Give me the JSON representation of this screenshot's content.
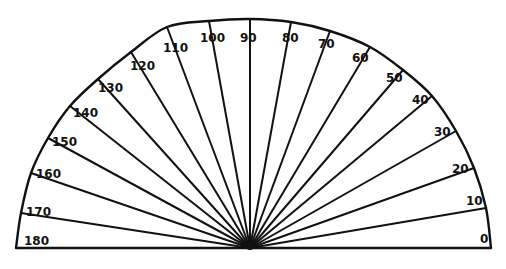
{
  "diagram": {
    "title": "",
    "type": "protractor",
    "stroke_color": "#111111",
    "background": "#ffffff",
    "center": {
      "x": 250,
      "y": 248
    },
    "baseline": {
      "x1": 16,
      "x2": 491,
      "y": 248
    },
    "arc": {
      "rx": 237,
      "ry": 229
    },
    "ticks": [
      {
        "label": "0",
        "angle": 0,
        "end": [
          491,
          248
        ],
        "label_pos": [
          480,
          243
        ]
      },
      {
        "label": "10",
        "angle": 10,
        "end": [
          486,
          208
        ],
        "label_pos": [
          466,
          205
        ]
      },
      {
        "label": "20",
        "angle": 20,
        "end": [
          474,
          168
        ],
        "label_pos": [
          452,
          173
        ]
      },
      {
        "label": "30",
        "angle": 30,
        "end": [
          456,
          131
        ],
        "label_pos": [
          434,
          136
        ]
      },
      {
        "label": "40",
        "angle": 40,
        "end": [
          432,
          96
        ],
        "label_pos": [
          412,
          104
        ]
      },
      {
        "label": "50",
        "angle": 50,
        "end": [
          403,
          70
        ],
        "label_pos": [
          386,
          82
        ]
      },
      {
        "label": "60",
        "angle": 60,
        "end": [
          370,
          47
        ],
        "label_pos": [
          352,
          62
        ]
      },
      {
        "label": "70",
        "angle": 70,
        "end": [
          330,
          31
        ],
        "label_pos": [
          318,
          48
        ]
      },
      {
        "label": "80",
        "angle": 80,
        "end": [
          291,
          22
        ],
        "label_pos": [
          282,
          42
        ]
      },
      {
        "label": "90",
        "angle": 90,
        "end": [
          250,
          19
        ],
        "label_pos": [
          240,
          42
        ]
      },
      {
        "label": "100",
        "angle": 100,
        "end": [
          209,
          21
        ],
        "label_pos": [
          200,
          42
        ]
      },
      {
        "label": "110",
        "angle": 110,
        "end": [
          167,
          27
        ],
        "label_pos": [
          163,
          52
        ]
      },
      {
        "label": "120",
        "angle": 120,
        "end": [
          131,
          52
        ],
        "label_pos": [
          130,
          70
        ]
      },
      {
        "label": "130",
        "angle": 130,
        "end": [
          98,
          79
        ],
        "label_pos": [
          98,
          92
        ]
      },
      {
        "label": "140",
        "angle": 140,
        "end": [
          70,
          106
        ],
        "label_pos": [
          73,
          117
        ]
      },
      {
        "label": "150",
        "angle": 150,
        "end": [
          48,
          138
        ],
        "label_pos": [
          52,
          146
        ]
      },
      {
        "label": "160",
        "angle": 160,
        "end": [
          31,
          173
        ],
        "label_pos": [
          36,
          178
        ]
      },
      {
        "label": "170",
        "angle": 170,
        "end": [
          21,
          213
        ],
        "label_pos": [
          26,
          216
        ]
      },
      {
        "label": "180",
        "angle": 180,
        "end": [
          16,
          248
        ],
        "label_pos": [
          24,
          245
        ]
      }
    ]
  }
}
